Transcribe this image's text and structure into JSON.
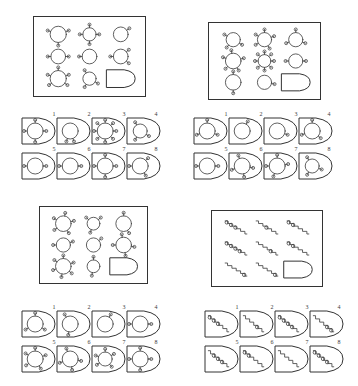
{
  "document": {
    "title": "Matrix Reasoning Test Sheet",
    "type": "non-verbal reasoning matrices",
    "puzzle_count": 4,
    "ink_color": "#444444",
    "border_color": "#333333",
    "background_color": "#ffffff"
  },
  "puzzles": [
    {
      "id": "puzzle-1",
      "position": "top-left",
      "matrix": {
        "rows": 3,
        "cols": 3,
        "missing_cell_index": 8,
        "missing_cell_label": "",
        "figure_family": "circle-with-lobes",
        "cells": [
          {
            "index": 0,
            "lobes": 3,
            "angles": [
              270,
              160,
              20
            ],
            "radius": 11
          },
          {
            "index": 1,
            "lobes": 4,
            "angles": [
              90,
              180,
              270,
              0
            ],
            "radius": 9
          },
          {
            "index": 2,
            "lobes": 1,
            "angles": [
              35
            ],
            "radius": 10
          },
          {
            "index": 3,
            "lobes": 2,
            "angles": [
              180,
              0
            ],
            "radius": 10
          },
          {
            "index": 4,
            "lobes": 1,
            "angles": [
              180
            ],
            "radius": 10
          },
          {
            "index": 5,
            "lobes": 3,
            "angles": [
              180,
              40,
              320
            ],
            "radius": 10
          },
          {
            "index": 6,
            "lobes": 5,
            "angles": [
              90,
              160,
              215,
              325,
              20
            ],
            "radius": 11
          },
          {
            "index": 7,
            "lobes": 3,
            "angles": [
              120,
              240,
              330
            ],
            "radius": 9
          },
          {
            "index": 8,
            "lobes": 0,
            "angles": [],
            "radius": 0
          }
        ]
      },
      "options": [
        {
          "number": "1",
          "lobes": 4,
          "angles": [
            90,
            180,
            270,
            0
          ],
          "radius": 8
        },
        {
          "number": "2",
          "lobes": 2,
          "angles": [
            250,
            290
          ],
          "radius": 8
        },
        {
          "number": "3",
          "lobes": 8,
          "angles": [
            90,
            135,
            180,
            225,
            270,
            315,
            0,
            45
          ],
          "radius": 8
        },
        {
          "number": "4",
          "lobes": 3,
          "angles": [
            120,
            240,
            330
          ],
          "radius": 7
        },
        {
          "number": "5",
          "lobes": 2,
          "angles": [
            180,
            0
          ],
          "radius": 8
        },
        {
          "number": "6",
          "lobes": 2,
          "angles": [
            180,
            0
          ],
          "radius": 8
        },
        {
          "number": "7",
          "lobes": 4,
          "angles": [
            90,
            180,
            270,
            0
          ],
          "radius": 8
        },
        {
          "number": "8",
          "lobes": 3,
          "angles": [
            180,
            45,
            300
          ],
          "radius": 8
        }
      ]
    },
    {
      "id": "puzzle-2",
      "position": "top-right",
      "matrix": {
        "rows": 3,
        "cols": 3,
        "missing_cell_index": 8,
        "missing_cell_label": "",
        "figure_family": "circle-with-lobes",
        "cells": [
          {
            "index": 0,
            "lobes": 3,
            "angles": [
              150,
              230,
              330
            ],
            "radius": 10
          },
          {
            "index": 1,
            "lobes": 5,
            "angles": [
              90,
              150,
              210,
              300,
              20
            ],
            "radius": 10
          },
          {
            "index": 2,
            "lobes": 3,
            "angles": [
              90,
              200,
              340
            ],
            "radius": 10
          },
          {
            "index": 3,
            "lobes": 5,
            "angles": [
              100,
              160,
              225,
              300,
              15
            ],
            "radius": 11
          },
          {
            "index": 4,
            "lobes": 8,
            "angles": [
              90,
              135,
              180,
              225,
              270,
              315,
              0,
              45
            ],
            "radius": 9
          },
          {
            "index": 5,
            "lobes": 2,
            "angles": [
              180,
              0
            ],
            "radius": 10
          },
          {
            "index": 6,
            "lobes": 2,
            "angles": [
              90,
              270
            ],
            "radius": 11
          },
          {
            "index": 7,
            "lobes": 1,
            "angles": [
              350
            ],
            "radius": 10
          },
          {
            "index": 8,
            "lobes": 0,
            "angles": [],
            "radius": 0
          }
        ]
      },
      "options": [
        {
          "number": "1",
          "lobes": 3,
          "angles": [
            90,
            200,
            340
          ],
          "radius": 8
        },
        {
          "number": "2",
          "lobes": 1,
          "angles": [
            60
          ],
          "radius": 8
        },
        {
          "number": "3",
          "lobes": 1,
          "angles": [
            340
          ],
          "radius": 8
        },
        {
          "number": "4",
          "lobes": 3,
          "angles": [
            90,
            200,
            320
          ],
          "radius": 8
        },
        {
          "number": "5",
          "lobes": 2,
          "angles": [
            180,
            0
          ],
          "radius": 8
        },
        {
          "number": "6",
          "lobes": 4,
          "angles": [
            110,
            200,
            280,
            350
          ],
          "radius": 8
        },
        {
          "number": "7",
          "lobes": 4,
          "angles": [
            90,
            180,
            250,
            10
          ],
          "radius": 8
        },
        {
          "number": "8",
          "lobes": 3,
          "angles": [
            120,
            240,
            340
          ],
          "radius": 7
        }
      ]
    },
    {
      "id": "puzzle-3",
      "position": "bottom-left",
      "matrix": {
        "rows": 3,
        "cols": 3,
        "missing_cell_index": 8,
        "missing_cell_label": "",
        "figure_family": "circle-with-lobes",
        "cells": [
          {
            "index": 0,
            "lobes": 5,
            "angles": [
              80,
              150,
              215,
              300,
              15
            ],
            "radius": 11
          },
          {
            "index": 1,
            "lobes": 3,
            "angles": [
              140,
              250,
              40
            ],
            "radius": 9
          },
          {
            "index": 2,
            "lobes": 2,
            "angles": [
              90,
              300
            ],
            "radius": 11
          },
          {
            "index": 3,
            "lobes": 2,
            "angles": [
              180,
              20
            ],
            "radius": 10
          },
          {
            "index": 4,
            "lobes": 1,
            "angles": [
              40
            ],
            "radius": 10
          },
          {
            "index": 5,
            "lobes": 4,
            "angles": [
              100,
              180,
              280,
              350
            ],
            "radius": 11
          },
          {
            "index": 6,
            "lobes": 6,
            "angles": [
              90,
              145,
              200,
              260,
              320,
              20
            ],
            "radius": 11
          },
          {
            "index": 7,
            "lobes": 2,
            "angles": [
              90,
              260
            ],
            "radius": 9
          },
          {
            "index": 8,
            "lobes": 0,
            "angles": [],
            "radius": 0
          }
        ]
      },
      "options": [
        {
          "number": "1",
          "lobes": 3,
          "angles": [
            90,
            210,
            330
          ],
          "radius": 8
        },
        {
          "number": "2",
          "lobes": 2,
          "angles": [
            120,
            260
          ],
          "radius": 8
        },
        {
          "number": "3",
          "lobes": 1,
          "angles": [
            60
          ],
          "radius": 8
        },
        {
          "number": "4",
          "lobes": 2,
          "angles": [
            180,
            0
          ],
          "radius": 8
        },
        {
          "number": "5",
          "lobes": 5,
          "angles": [
            90,
            150,
            215,
            300,
            20
          ],
          "radius": 8
        },
        {
          "number": "6",
          "lobes": 4,
          "angles": [
            110,
            200,
            280,
            350
          ],
          "radius": 8
        },
        {
          "number": "7",
          "lobes": 5,
          "angles": [
            90,
            160,
            215,
            310,
            30
          ],
          "radius": 7
        },
        {
          "number": "8",
          "lobes": 4,
          "angles": [
            90,
            180,
            270,
            0
          ],
          "radius": 8
        }
      ]
    },
    {
      "id": "puzzle-4",
      "position": "bottom-right",
      "matrix": {
        "rows": 3,
        "cols": 3,
        "missing_cell_index": 8,
        "missing_cell_label": "",
        "figure_family": "staircase-with-beads",
        "cells": [
          {
            "index": 0,
            "steps": 5,
            "beads": 3,
            "bead_start": 0,
            "direction": "down-right"
          },
          {
            "index": 1,
            "steps": 5,
            "beads": 1,
            "bead_start": 2,
            "direction": "down-right"
          },
          {
            "index": 2,
            "steps": 5,
            "beads": 2,
            "bead_start": 0,
            "direction": "down-right"
          },
          {
            "index": 3,
            "steps": 5,
            "beads": 4,
            "bead_start": 0,
            "direction": "down-right"
          },
          {
            "index": 4,
            "steps": 5,
            "beads": 1,
            "bead_start": 3,
            "direction": "down-right"
          },
          {
            "index": 5,
            "steps": 5,
            "beads": 2,
            "bead_start": 0,
            "direction": "down-right"
          },
          {
            "index": 6,
            "steps": 5,
            "beads": 1,
            "bead_start": 4,
            "direction": "down-right"
          },
          {
            "index": 7,
            "steps": 5,
            "beads": 1,
            "bead_start": 4,
            "direction": "down-right"
          },
          {
            "index": 8,
            "steps": 0,
            "beads": 0,
            "bead_start": 0,
            "direction": ""
          }
        ]
      },
      "options": [
        {
          "number": "1",
          "steps": 5,
          "beads": 3,
          "bead_start": 0
        },
        {
          "number": "2",
          "steps": 5,
          "beads": 1,
          "bead_start": 3
        },
        {
          "number": "3",
          "steps": 5,
          "beads": 4,
          "bead_start": 0
        },
        {
          "number": "4",
          "steps": 5,
          "beads": 2,
          "bead_start": 3
        },
        {
          "number": "5",
          "steps": 5,
          "beads": 3,
          "bead_start": 1
        },
        {
          "number": "6",
          "steps": 5,
          "beads": 2,
          "bead_start": 0
        },
        {
          "number": "7",
          "steps": 5,
          "beads": 0,
          "bead_start": 0
        },
        {
          "number": "8",
          "steps": 5,
          "beads": 4,
          "bead_start": 0
        }
      ]
    }
  ]
}
